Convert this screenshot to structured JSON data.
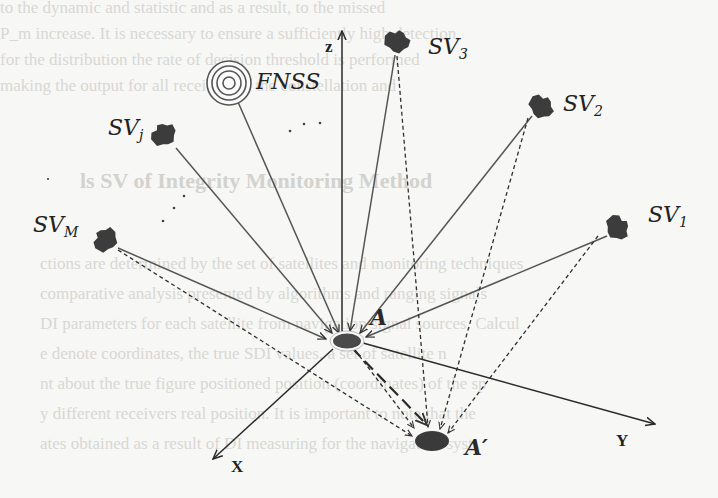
{
  "figure": {
    "type": "diagram",
    "axes": {
      "z": "z",
      "x": "X",
      "y": "Y"
    },
    "points": {
      "true_position": "A",
      "spoofed_position": "A′"
    },
    "spoofer": {
      "label": "FNSS",
      "icon": "concentric-rings-icon"
    },
    "satellites": [
      {
        "id": "sv3",
        "base": "SV",
        "sub": "3"
      },
      {
        "id": "sv2",
        "base": "SV",
        "sub": "2"
      },
      {
        "id": "sv1",
        "base": "SV",
        "sub": "1"
      },
      {
        "id": "svj",
        "base": "SV",
        "sub": "j"
      },
      {
        "id": "svm",
        "base": "SV",
        "sub": "M"
      }
    ],
    "legend_semantics": {
      "solid_line": "true signal path to A",
      "dashed_line": "spoofed signal path to A′",
      "long_dash_arrow": "displacement A to A′"
    }
  },
  "colors": {
    "ink": "#2a2a2a",
    "satellite": "#3c3c3c",
    "background": "#f7f7f5",
    "bleed_text": "#d8d8d4"
  },
  "background_bleed": {
    "lines": [
      "to the dynamic and statistic and as a result, to the missed",
      "P_m increase. It is necessary to ensure a sufficiently high detection",
      "for the distribution the rate of decision threshold is performed",
      "making the output for all receivers at the constellation and",
      "",
      "ls SV of Integrity Monitoring Method",
      "",
      "ctions are determined by the set of satellites and monitoring techniques",
      "comparative analysis presented by algorithms and ranging signals",
      "DI parameters for each satellite from navigation signal sources. Calcul",
      "e denote coordinates, the true SDI values, a set of satellite n",
      "nt about the true figure positioned position (coordinates) of the sp",
      "y different receivers real position. It is important to note that the",
      "ates obtained as a result of DI measuring for the navigation syst"
    ]
  }
}
